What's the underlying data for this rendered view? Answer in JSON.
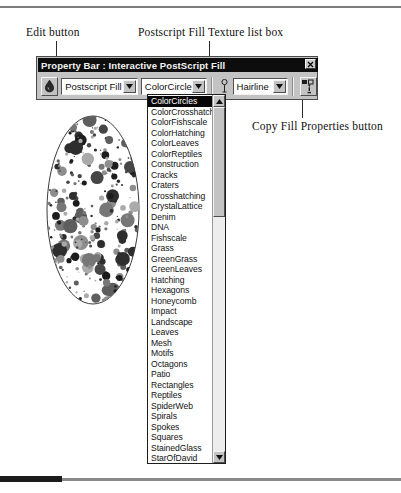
{
  "annotations": [
    {
      "id": "edit",
      "label": "Edit button"
    },
    {
      "id": "texture",
      "label": "Postscript Fill Texture list box"
    },
    {
      "id": "copy",
      "label": "Copy Fill Properties button"
    }
  ],
  "window": {
    "title": "Property Bar : Interactive PostScript Fill",
    "close_label": "×"
  },
  "toolbar": {
    "edit_button_name": "Edit button",
    "fill_type": {
      "value": "Postscript Fill",
      "arrow": "▼"
    },
    "texture": {
      "value": "ColorCircles",
      "arrow": "▼"
    },
    "outline": {
      "value": "Hairline",
      "arrow": "▼"
    },
    "copy_button_name": "Copy Fill Properties button"
  },
  "dropdown": {
    "selected": "ColorCircles",
    "scroll_up": "▲",
    "scroll_down": "▼",
    "items": [
      "ColorCircles",
      "ColorCrosshatch",
      "ColorFishscale",
      "ColorHatching",
      "ColorLeaves",
      "ColorReptiles",
      "Construction",
      "Cracks",
      "Craters",
      "Crosshatching",
      "CrystalLattice",
      "Denim",
      "DNA",
      "Fishscale",
      "Grass",
      "GreenGrass",
      "GreenLeaves",
      "Hatching",
      "Hexagons",
      "Honeycomb",
      "Impact",
      "Landscape",
      "Leaves",
      "Mesh",
      "Motifs",
      "Octagons",
      "Patio",
      "Rectangles",
      "Reptiles",
      "SpiderWeb",
      "Spirals",
      "Spokes",
      "Squares",
      "StainedGlass",
      "StarOfDavid",
      "Stars"
    ]
  },
  "artwork": {
    "name": "ellipse-with-colorcircles-fill"
  },
  "colors": {
    "window_face": "#c3c3c3",
    "titlebar": "#0d0d0d",
    "titlebar_text": "#f2f2f2",
    "field_bg": "#ffffff",
    "selection_bg": "#060606",
    "selection_text": "#ffffff",
    "text": "#121212"
  }
}
